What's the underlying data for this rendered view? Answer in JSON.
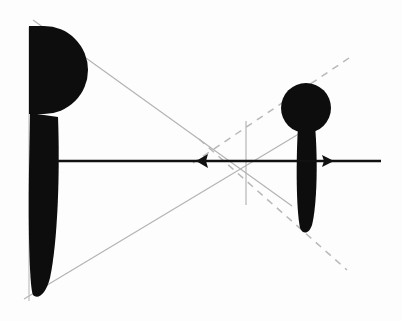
{
  "figure": {
    "type": "perspective-scale-diagram",
    "title": "",
    "canvas": {
      "width": 402,
      "height": 321,
      "background": "#fdfdfd"
    },
    "colors": {
      "silhouette": "#0d0d0d",
      "axis": "#111111",
      "construction_solid": "#b3b3b3",
      "construction_dashed": "#b8b8b8",
      "background": "#fdfdfd"
    },
    "figures": [
      {
        "name": "near-figure-left",
        "label": "",
        "head_shape": "semicircle",
        "head_center": {
          "x": 44,
          "y": 68
        },
        "head_radius": 44,
        "body_top": {
          "x": 44,
          "y": 115
        },
        "body_bottom": {
          "x": 44,
          "y": 297
        },
        "body_top_width": 30,
        "body_bottom_width": 22,
        "eye_level_y": 161
      },
      {
        "name": "far-figure-right",
        "label": "",
        "head_shape": "circle",
        "head_center": {
          "x": 306,
          "y": 108
        },
        "head_radius": 25,
        "body_top": {
          "x": 306,
          "y": 128
        },
        "body_bottom": {
          "x": 306,
          "y": 232
        },
        "body_top_width": 17,
        "body_bottom_width": 13,
        "eye_level_y": 161
      }
    ],
    "axis": {
      "name": "eye-level-horizon",
      "label": "",
      "y": 161,
      "x_start": 57,
      "x_end": 381,
      "stroke_width": 2.6,
      "arrow_left_at_x": 196,
      "arrow_right_at_x": 334
    },
    "construction_lines": [
      {
        "name": "upper-convergence-solid",
        "style": "solid",
        "x1": 33,
        "y1": 20,
        "x2": 290,
        "y2": 205
      },
      {
        "name": "lower-convergence-solid",
        "style": "solid",
        "x1": 26,
        "y1": 297,
        "x2": 300,
        "y2": 133
      },
      {
        "name": "upper-dashed-ray",
        "style": "dashed",
        "x1": 348,
        "y1": 60,
        "x2": 196,
        "y2": 161
      },
      {
        "name": "lower-dashed-ray",
        "style": "dashed",
        "x1": 200,
        "y1": 140,
        "x2": 345,
        "y2": 268
      },
      {
        "name": "vertical-measure-line",
        "style": "solid",
        "x1": 246,
        "y1": 122,
        "x2": 246,
        "y2": 203
      },
      {
        "name": "left-vertical-edge",
        "style": "solid",
        "x1": 29,
        "y1": 28,
        "x2": 29,
        "y2": 300
      }
    ],
    "vanishing_points": [
      {
        "name": "upper-vanishing-point",
        "x": 246,
        "y": 122
      },
      {
        "name": "lower-vanishing-point",
        "x": 246,
        "y": 203
      }
    ],
    "annotations": []
  }
}
